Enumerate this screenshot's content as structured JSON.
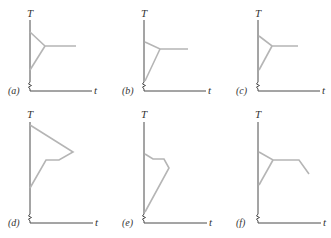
{
  "figure": {
    "axis_labels": {
      "y": "T",
      "x": "t"
    },
    "colors": {
      "axis": "#4a4a4a",
      "curve": "#b5b5b5"
    },
    "panels": [
      {
        "id": "a",
        "label": "(a)",
        "origin": [
          31,
          91
        ],
        "y_top": 20,
        "x_end": 92,
        "label_pos": [
          8,
          94
        ],
        "T_pos": [
          27,
          17
        ],
        "t_pos": [
          94,
          94
        ],
        "curves": [
          "30,32 45,46 76,46",
          "30,70 45,46"
        ]
      },
      {
        "id": "b",
        "label": "(b)",
        "origin": [
          145,
          91
        ],
        "y_top": 20,
        "x_end": 206,
        "label_pos": [
          122,
          94
        ],
        "T_pos": [
          141,
          17
        ],
        "t_pos": [
          208,
          94
        ],
        "curves": [
          "145,42 160,49 188,49",
          "145,81 160,49"
        ]
      },
      {
        "id": "c",
        "label": "(c)",
        "origin": [
          259,
          91
        ],
        "y_top": 20,
        "x_end": 320,
        "label_pos": [
          236,
          94
        ],
        "T_pos": [
          255,
          17
        ],
        "t_pos": [
          322,
          94
        ],
        "curves": [
          "259,36 272,46 298,46",
          "259,70 272,46"
        ]
      },
      {
        "id": "d",
        "label": "(d)",
        "origin": [
          31,
          223
        ],
        "y_top": 122,
        "x_end": 93,
        "label_pos": [
          8,
          226
        ],
        "T_pos": [
          27,
          118
        ],
        "t_pos": [
          95,
          226
        ],
        "curves": [
          "30,125 73,152 59,160 46,160 30,188"
        ]
      },
      {
        "id": "e",
        "label": "(e)",
        "origin": [
          145,
          223
        ],
        "y_top": 122,
        "x_end": 207,
        "label_pos": [
          122,
          226
        ],
        "T_pos": [
          141,
          118
        ],
        "t_pos": [
          209,
          226
        ],
        "curves": [
          "145,154 153,159 164,159 169,168 145,212"
        ]
      },
      {
        "id": "f",
        "label": "(f)",
        "origin": [
          259,
          223
        ],
        "y_top": 122,
        "x_end": 321,
        "label_pos": [
          236,
          226
        ],
        "T_pos": [
          255,
          118
        ],
        "t_pos": [
          323,
          226
        ],
        "curves": [
          "259,152 273,160 299,160 309,174",
          "259,185 273,160"
        ]
      }
    ]
  }
}
